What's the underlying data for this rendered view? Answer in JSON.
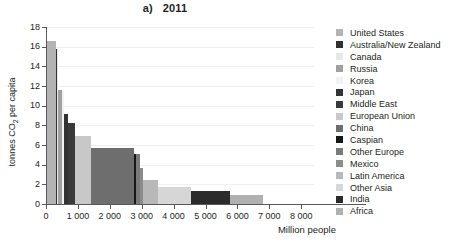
{
  "chart_data": {
    "type": "bar",
    "title": "a)   2011",
    "xlabel": "Million people",
    "ylabel": "tonnes CO2 per capita",
    "xlim": [
      0,
      8400
    ],
    "ylim": [
      0,
      18
    ],
    "xticks": [
      0,
      1000,
      2000,
      3000,
      4000,
      5000,
      6000,
      7000,
      8000
    ],
    "xtick_labels": [
      "0",
      "1 000",
      "2 000",
      "3 000",
      "4 000",
      "5 000",
      "6 000",
      "7 000",
      "8 000"
    ],
    "yticks": [
      0,
      2,
      4,
      6,
      8,
      10,
      12,
      14,
      16,
      18
    ],
    "ytick_labels": [
      "0",
      "2",
      "4",
      "6",
      "8",
      "10",
      "12",
      "14",
      "16",
      "18"
    ],
    "grid": true,
    "legend_position": "right",
    "note": "Marimekko / variable-width bar chart: bar width = population (million people), bar height = tonnes CO2 per capita",
    "categories": [
      "United States",
      "Australia/New Zealand",
      "Canada",
      "Russia",
      "Korea",
      "Japan",
      "Middle East",
      "European Union",
      "China",
      "Caspian",
      "Other Europe",
      "Mexico",
      "Latin America",
      "Other Asia",
      "India",
      "Africa"
    ],
    "series": [
      {
        "name": "tonnes CO2 per capita",
        "values": [
          16.6,
          15.8,
          15.8,
          11.6,
          11.6,
          9.2,
          8.2,
          6.9,
          5.7,
          5.1,
          5.1,
          3.7,
          2.4,
          1.7,
          1.3,
          0.9
        ]
      },
      {
        "name": "Million people",
        "values": [
          312,
          27,
          34,
          143,
          50,
          128,
          210,
          505,
          1345,
          78,
          108,
          114,
          462,
          1020,
          1240,
          1010
        ]
      }
    ],
    "bars": [
      {
        "label": "United States",
        "population": 312,
        "per_capita": 16.6,
        "color": "#b3b3b3"
      },
      {
        "label": "Australia/New Zealand",
        "population": 27,
        "per_capita": 15.8,
        "color": "#313131"
      },
      {
        "label": "Canada",
        "population": 34,
        "per_capita": 15.8,
        "color": "#e8e8e8"
      },
      {
        "label": "Russia",
        "population": 143,
        "per_capita": 11.6,
        "color": "#a0a0a0"
      },
      {
        "label": "Korea",
        "population": 50,
        "per_capita": 11.6,
        "color": "#f2f2f2"
      },
      {
        "label": "Japan",
        "population": 128,
        "per_capita": 9.2,
        "color": "#333333"
      },
      {
        "label": "Middle East",
        "population": 210,
        "per_capita": 8.2,
        "color": "#3a3a3a"
      },
      {
        "label": "European Union",
        "population": 505,
        "per_capita": 6.9,
        "color": "#c8c8c8"
      },
      {
        "label": "China",
        "population": 1345,
        "per_capita": 5.7,
        "color": "#6e6e6e"
      },
      {
        "label": "Caspian",
        "population": 78,
        "per_capita": 5.1,
        "color": "#171717"
      },
      {
        "label": "Other Europe",
        "population": 108,
        "per_capita": 5.1,
        "color": "#7a7a7a"
      },
      {
        "label": "Mexico",
        "population": 114,
        "per_capita": 3.7,
        "color": "#8c8c8c"
      },
      {
        "label": "Latin America",
        "population": 462,
        "per_capita": 2.4,
        "color": "#b8b8b8"
      },
      {
        "label": "Other Asia",
        "population": 1020,
        "per_capita": 1.7,
        "color": "#d6d6d6"
      },
      {
        "label": "India",
        "population": 1240,
        "per_capita": 1.3,
        "color": "#2b2b2b"
      },
      {
        "label": "Africa",
        "population": 1010,
        "per_capita": 0.9,
        "color": "#b0b0b0"
      }
    ]
  },
  "legend": {
    "items": [
      {
        "label": "United States",
        "color": "#b3b3b3"
      },
      {
        "label": "Australia/New Zealand",
        "color": "#313131"
      },
      {
        "label": "Canada",
        "color": "#e8e8e8"
      },
      {
        "label": "Russia",
        "color": "#a0a0a0"
      },
      {
        "label": "Korea",
        "color": "#f2f2f2"
      },
      {
        "label": "Japan",
        "color": "#333333"
      },
      {
        "label": "Middle East",
        "color": "#3a3a3a"
      },
      {
        "label": "European Union",
        "color": "#c8c8c8"
      },
      {
        "label": "China",
        "color": "#6e6e6e"
      },
      {
        "label": "Caspian",
        "color": "#171717"
      },
      {
        "label": "Other Europe",
        "color": "#7a7a7a"
      },
      {
        "label": "Mexico",
        "color": "#8c8c8c"
      },
      {
        "label": "Latin America",
        "color": "#b8b8b8"
      },
      {
        "label": "Other Asia",
        "color": "#d6d6d6"
      },
      {
        "label": "India",
        "color": "#2b2b2b"
      },
      {
        "label": "Africa",
        "color": "#b0b0b0"
      }
    ]
  }
}
